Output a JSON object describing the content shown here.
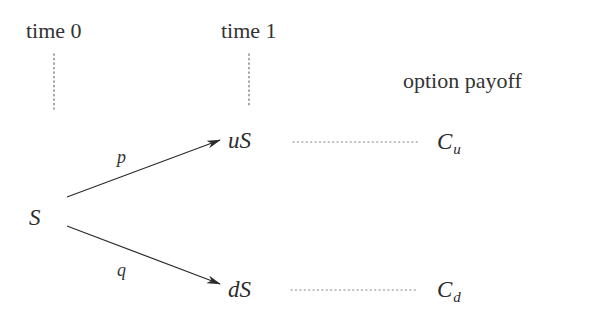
{
  "diagram": {
    "type": "binomial-tree",
    "headers": {
      "time0": "time 0",
      "time1": "time 1",
      "payoff": "option payoff"
    },
    "nodes": {
      "root": {
        "label": "S"
      },
      "up": {
        "label": "uS"
      },
      "down": {
        "label": "dS"
      }
    },
    "edges": {
      "up": {
        "label": "p",
        "from": "S",
        "to": "uS"
      },
      "down": {
        "label": "q",
        "from": "S",
        "to": "dS"
      }
    },
    "payoffs": {
      "up": {
        "base": "C",
        "sub": "u"
      },
      "down": {
        "base": "C",
        "sub": "d"
      }
    },
    "colors": {
      "ink": "#2b2b2b",
      "dotted": "#777777",
      "background": "#ffffff"
    }
  }
}
